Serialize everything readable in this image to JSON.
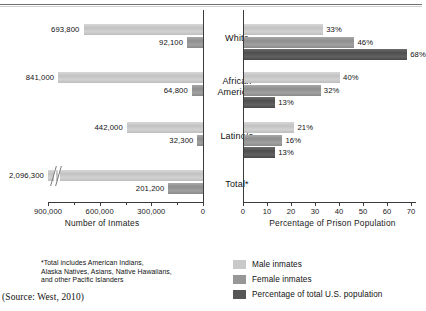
{
  "chart_data": {
    "type": "bar",
    "orientation": "horizontal",
    "layout": "two-panel back-to-back grouped bar chart",
    "categories": [
      "White",
      "African American",
      "Latino/a",
      "Total*"
    ],
    "panels": [
      {
        "id": "left",
        "xlabel": "Number of Inmates",
        "xlim": [
          0,
          900000
        ],
        "axis_direction": "reversed",
        "tick_labels": [
          "900,000",
          "600,000",
          "300,000",
          "0"
        ],
        "tick_values": [
          900000,
          600000,
          300000,
          0
        ],
        "minor_ticks": true,
        "series": [
          {
            "name": "Male inmates",
            "values": [
              693800,
              841000,
              442000,
              2096300
            ],
            "labels": [
              "693,800",
              "841,000",
              "442,000",
              "2,096,300"
            ]
          },
          {
            "name": "Female inmates",
            "values": [
              92100,
              64800,
              32300,
              201200
            ],
            "labels": [
              "92,100",
              "64,800",
              "32,300",
              "201,200"
            ]
          }
        ],
        "notes": "Total male bar (2,096,300) exceeds the axis range and is drawn with an axis-break symbol."
      },
      {
        "id": "right",
        "xlabel": "Percentage of Prison Population",
        "xlim": [
          0,
          70
        ],
        "axis_direction": "normal",
        "tick_labels": [
          "0",
          "10",
          "20",
          "30",
          "40",
          "50",
          "60",
          "70"
        ],
        "tick_values": [
          0,
          10,
          20,
          30,
          40,
          50,
          60,
          70
        ],
        "series": [
          {
            "name": "Male inmates",
            "values": [
              33,
              40,
              21,
              null
            ],
            "labels": [
              "33%",
              "40%",
              "21%",
              ""
            ]
          },
          {
            "name": "Female inmates",
            "values": [
              46,
              32,
              16,
              null
            ],
            "labels": [
              "46%",
              "32%",
              "16%",
              ""
            ]
          },
          {
            "name": "Percentage of total U.S. population",
            "values": [
              68,
              13,
              13,
              null
            ],
            "labels": [
              "68%",
              "13%",
              "13%",
              ""
            ]
          }
        ],
        "notes": "No bars are plotted for the Total* category in this panel."
      }
    ],
    "legend": {
      "position": "bottom-right",
      "entries": [
        {
          "label": "Male inmates",
          "color": "#c9c9c9"
        },
        {
          "label": "Female inmates",
          "color": "#979797"
        },
        {
          "label": "Percentage of total U.S. population",
          "color": "#555555"
        }
      ]
    },
    "footnote": [
      "*Total includes American Indians,",
      "Alaska Natives, Asians, Native Hawaiians,",
      "and other Pacific Islanders"
    ],
    "source": "(Source: West, 2010)",
    "grid": false
  }
}
